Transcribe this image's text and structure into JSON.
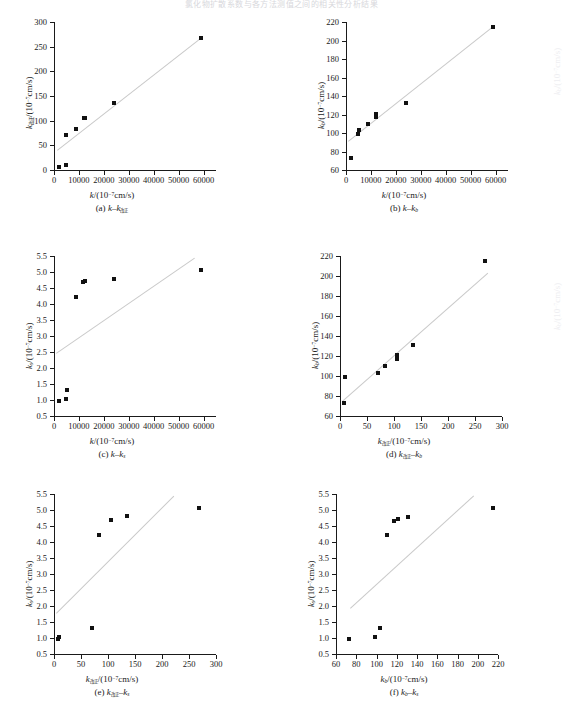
{
  "figure": {
    "header_fragment": "氯化物扩散系数与各方法测值之间的相关性分析结果",
    "unit_x_generic": "/(10⁻⁷cm/s)",
    "marker_color": "#111111",
    "fit_line_color": "#c9c9c9",
    "axis_color": "#1a1a1a"
  },
  "chart_data": [
    {
      "id": "a",
      "type": "scatter",
      "caption": "(a) k–k改正",
      "caption_parts": {
        "prefix": "(a)",
        "v1": "k",
        "sub1": "",
        "dash": "–",
        "v2": "k",
        "sub2": "改正"
      },
      "title": "",
      "xlabel": "k/(10⁻⁷cm/s)",
      "xlabel_parts": {
        "sym": "k",
        "sub": "",
        "unit": "/(10⁻⁷cm/s)"
      },
      "ylabel": "k改正/(10⁻⁷cm/s)",
      "ylabel_parts": {
        "sym": "k",
        "sub": "改正",
        "unit": "/(10⁻⁷cm/s)"
      },
      "xlim": [
        0,
        65000
      ],
      "ylim": [
        0,
        300
      ],
      "xticks": [
        0,
        10000,
        20000,
        30000,
        40000,
        50000,
        60000
      ],
      "xticklabels": [
        "0",
        "10000",
        "20000",
        "30000",
        "40000",
        "50000",
        "60000"
      ],
      "yticks": [
        0,
        50,
        100,
        150,
        200,
        250,
        300
      ],
      "yticklabels": [
        "0",
        "50",
        "100",
        "150",
        "200",
        "250",
        "300"
      ],
      "grid": false,
      "legend": "none",
      "points": [
        {
          "x": 2000,
          "y": 7
        },
        {
          "x": 5000,
          "y": 10
        },
        {
          "x": 5000,
          "y": 71
        },
        {
          "x": 9000,
          "y": 83
        },
        {
          "x": 12000,
          "y": 105
        },
        {
          "x": 12300,
          "y": 106
        },
        {
          "x": 24000,
          "y": 136
        },
        {
          "x": 59000,
          "y": 268
        }
      ],
      "fit": {
        "x0": 1200,
        "y0": 41,
        "x1": 59500,
        "y1": 271
      }
    },
    {
      "id": "b",
      "type": "scatter",
      "caption": "(b) k–kb",
      "caption_parts": {
        "prefix": "(b)",
        "v1": "k",
        "sub1": "",
        "dash": "–",
        "v2": "k",
        "sub2": "b"
      },
      "title": "",
      "xlabel": "k/(10⁻⁷cm/s)",
      "xlabel_parts": {
        "sym": "k",
        "sub": "",
        "unit": "/(10⁻⁷cm/s)"
      },
      "ylabel": "kb/(10⁻⁷cm/s)",
      "ylabel_parts": {
        "sym": "k",
        "sub": "b",
        "unit": "/(10⁻⁷cm/s)"
      },
      "xlim": [
        0,
        65000
      ],
      "ylim": [
        60,
        220
      ],
      "xticks": [
        0,
        10000,
        20000,
        30000,
        40000,
        50000,
        60000
      ],
      "xticklabels": [
        "0",
        "10000",
        "20000",
        "30000",
        "40000",
        "50000",
        "60000"
      ],
      "yticks": [
        60,
        80,
        100,
        120,
        140,
        160,
        180,
        200,
        220
      ],
      "yticklabels": [
        "60",
        "80",
        "100",
        "120",
        "140",
        "160",
        "180",
        "200",
        "220"
      ],
      "grid": false,
      "legend": "none",
      "points": [
        {
          "x": 2000,
          "y": 73
        },
        {
          "x": 5000,
          "y": 99
        },
        {
          "x": 5200,
          "y": 103
        },
        {
          "x": 9000,
          "y": 110
        },
        {
          "x": 12000,
          "y": 117
        },
        {
          "x": 12200,
          "y": 121
        },
        {
          "x": 24000,
          "y": 132
        },
        {
          "x": 59000,
          "y": 215
        }
      ],
      "fit": {
        "x0": 1000,
        "y0": 91,
        "x1": 59500,
        "y1": 216
      }
    },
    {
      "id": "c",
      "type": "scatter",
      "caption": "(c) k–ks",
      "caption_parts": {
        "prefix": "(c)",
        "v1": "k",
        "sub1": "",
        "dash": "–",
        "v2": "k",
        "sub2": "s"
      },
      "title": "",
      "xlabel": "k/(10⁻⁷cm/s)",
      "xlabel_parts": {
        "sym": "k",
        "sub": "",
        "unit": "/(10⁻⁷cm/s)"
      },
      "ylabel": "ks/(10⁻⁷cm/s)",
      "ylabel_parts": {
        "sym": "k",
        "sub": "s",
        "unit": "/(10⁻⁷cm/s)"
      },
      "xlim": [
        0,
        65000
      ],
      "ylim": [
        0.5,
        5.5
      ],
      "xticks": [
        0,
        10000,
        20000,
        30000,
        40000,
        50000,
        60000
      ],
      "xticklabels": [
        "0",
        "10000",
        "20000",
        "30000",
        "40000",
        "50000",
        "60000"
      ],
      "yticks": [
        0.5,
        1.0,
        1.5,
        2.0,
        2.5,
        3.0,
        3.5,
        4.0,
        4.5,
        5.0,
        5.5
      ],
      "yticklabels": [
        "0.5",
        "1.0",
        "1.5",
        "2.0",
        "2.5",
        "3.0",
        "3.5",
        "4.0",
        "4.5",
        "5.0",
        "5.5"
      ],
      "grid": false,
      "legend": "none",
      "points": [
        {
          "x": 2000,
          "y": 0.96
        },
        {
          "x": 5000,
          "y": 1.03
        },
        {
          "x": 5100,
          "y": 1.32
        },
        {
          "x": 9000,
          "y": 4.23
        },
        {
          "x": 11800,
          "y": 4.7
        },
        {
          "x": 12300,
          "y": 4.72
        },
        {
          "x": 24000,
          "y": 4.79
        },
        {
          "x": 59000,
          "y": 5.06
        }
      ],
      "fit": {
        "x0": 1000,
        "y0": 2.47,
        "x1": 56500,
        "y1": 5.45
      }
    },
    {
      "id": "d",
      "type": "scatter",
      "caption": "(d) k改正–kb",
      "caption_parts": {
        "prefix": "(d)",
        "v1": "k",
        "sub1": "改正",
        "dash": "–",
        "v2": "k",
        "sub2": "b"
      },
      "title": "",
      "xlabel": "k改正/(10⁻⁷cm/s)",
      "xlabel_parts": {
        "sym": "k",
        "sub": "改正",
        "unit": "/(10⁻⁷cm/s)"
      },
      "ylabel": "kb/(10⁻⁷cm/s)",
      "ylabel_parts": {
        "sym": "k",
        "sub": "b",
        "unit": "/(10⁻⁷cm/s)"
      },
      "xlim": [
        0,
        300
      ],
      "ylim": [
        60,
        220
      ],
      "xticks": [
        0,
        50,
        100,
        150,
        200,
        250,
        300
      ],
      "xticklabels": [
        "0",
        "50",
        "100",
        "150",
        "200",
        "250",
        "300"
      ],
      "yticks": [
        60,
        80,
        100,
        120,
        140,
        160,
        180,
        200,
        220
      ],
      "yticklabels": [
        "60",
        "80",
        "100",
        "120",
        "140",
        "160",
        "180",
        "200",
        "220"
      ],
      "grid": false,
      "legend": "none",
      "points": [
        {
          "x": 7,
          "y": 73
        },
        {
          "x": 9,
          "y": 99
        },
        {
          "x": 71,
          "y": 103
        },
        {
          "x": 83,
          "y": 110
        },
        {
          "x": 105,
          "y": 117
        },
        {
          "x": 106,
          "y": 121
        },
        {
          "x": 136,
          "y": 131
        },
        {
          "x": 269,
          "y": 215
        }
      ],
      "fit": {
        "x0": 3,
        "y0": 75,
        "x1": 272,
        "y1": 203
      }
    },
    {
      "id": "e",
      "type": "scatter",
      "caption": "(e) k改正–ks",
      "caption_parts": {
        "prefix": "(e)",
        "v1": "k",
        "sub1": "改正",
        "dash": "–",
        "v2": "k",
        "sub2": "s"
      },
      "title": "",
      "xlabel": "k改正/(10⁻⁷cm/s)",
      "xlabel_parts": {
        "sym": "k",
        "sub": "改正",
        "unit": "/(10⁻⁷cm/s)"
      },
      "ylabel": "ks/(10⁻⁷cm/s)",
      "ylabel_parts": {
        "sym": "k",
        "sub": "s",
        "unit": "/(10⁻⁷cm/s)"
      },
      "xlim": [
        0,
        300
      ],
      "ylim": [
        0.5,
        5.5
      ],
      "xticks": [
        0,
        50,
        100,
        150,
        200,
        250,
        300
      ],
      "xticklabels": [
        "0",
        "50",
        "100",
        "150",
        "200",
        "250",
        "300"
      ],
      "yticks": [
        0.5,
        1.0,
        1.5,
        2.0,
        2.5,
        3.0,
        3.5,
        4.0,
        4.5,
        5.0,
        5.5
      ],
      "yticklabels": [
        "0.5",
        "1.0",
        "1.5",
        "2.0",
        "2.5",
        "3.0",
        "3.5",
        "4.0",
        "4.5",
        "5.0",
        "5.5"
      ],
      "grid": false,
      "legend": "none",
      "points": [
        {
          "x": 7,
          "y": 0.96
        },
        {
          "x": 9,
          "y": 1.02
        },
        {
          "x": 71,
          "y": 1.32
        },
        {
          "x": 83,
          "y": 4.23
        },
        {
          "x": 105,
          "y": 4.7
        },
        {
          "x": 136,
          "y": 4.8
        },
        {
          "x": 269,
          "y": 5.06
        }
      ],
      "fit": {
        "x0": 4,
        "y0": 1.78,
        "x1": 222,
        "y1": 5.45
      }
    },
    {
      "id": "f",
      "type": "scatter",
      "caption": "(f) kb–ks",
      "caption_parts": {
        "prefix": "(f)",
        "v1": "k",
        "sub1": "b",
        "dash": "–",
        "v2": "k",
        "sub2": "s"
      },
      "title": "",
      "xlabel": "kb/(10⁻⁷cm/s)",
      "xlabel_parts": {
        "sym": "k",
        "sub": "b",
        "unit": "/(10⁻⁷cm/s)"
      },
      "ylabel": "ks/(10⁻⁷cm/s)",
      "ylabel_parts": {
        "sym": "k",
        "sub": "s",
        "unit": "/(10⁻⁷cm/s)"
      },
      "xlim": [
        60,
        220
      ],
      "ylim": [
        0.5,
        5.5
      ],
      "xticks": [
        60,
        80,
        100,
        120,
        140,
        160,
        180,
        200,
        220
      ],
      "xticklabels": [
        "60",
        "80",
        "100",
        "120",
        "140",
        "160",
        "180",
        "200",
        "220"
      ],
      "yticks": [
        0.5,
        1.0,
        1.5,
        2.0,
        2.5,
        3.0,
        3.5,
        4.0,
        4.5,
        5.0,
        5.5
      ],
      "yticklabels": [
        "0.5",
        "1.0",
        "1.5",
        "2.0",
        "2.5",
        "3.0",
        "3.5",
        "4.0",
        "4.5",
        "5.0",
        "5.5"
      ],
      "grid": false,
      "legend": "none",
      "points": [
        {
          "x": 73,
          "y": 0.96
        },
        {
          "x": 99,
          "y": 1.02
        },
        {
          "x": 103,
          "y": 1.31
        },
        {
          "x": 110,
          "y": 4.22
        },
        {
          "x": 117,
          "y": 4.67
        },
        {
          "x": 121,
          "y": 4.72
        },
        {
          "x": 131,
          "y": 4.79
        },
        {
          "x": 215,
          "y": 5.05
        }
      ],
      "fit": {
        "x0": 74,
        "y0": 1.93,
        "x1": 196,
        "y1": 5.45
      }
    }
  ]
}
